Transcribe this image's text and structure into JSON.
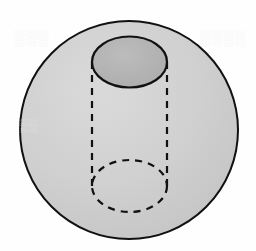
{
  "figure": {
    "title": "Sphere with inscribed cylinder",
    "background_color": "#fefefe",
    "canvas": {
      "width": 256,
      "height": 251
    }
  },
  "sphere": {
    "name": "sphere",
    "center_x": 129,
    "center_y": 130,
    "radius_x": 109,
    "radius_y": 109,
    "fill_color": "#cfcfcf",
    "stroke_color": "#111111",
    "stroke_width": 2.0
  },
  "cylinder": {
    "name": "cylinder",
    "axis_x": 129.5,
    "radius_x": 37.5,
    "top": {
      "label": "cylinder-top-ellipse",
      "center_y": 62,
      "radius_y": 25.5,
      "fill_color": "#b4b4b4",
      "stroke_color": "#111111",
      "stroke_width": 2.2,
      "stroke_style": "solid"
    },
    "bottom": {
      "label": "cylinder-bottom-ellipse",
      "center_y": 186,
      "radius_y": 26,
      "fill_color": "none",
      "stroke_color": "#111111",
      "stroke_width": 2.2,
      "stroke_style": "dashed",
      "dash_pattern": "7 6"
    },
    "left_side": {
      "label": "cylinder-left-side",
      "x": 92,
      "y_start": 62,
      "y_end": 186,
      "stroke_color": "#111111",
      "stroke_width": 2.2,
      "stroke_style": "dashed",
      "dash_pattern": "7 6"
    },
    "right_side": {
      "label": "cylinder-right-side",
      "x": 167,
      "y_start": 62,
      "y_end": 186,
      "stroke_color": "#111111",
      "stroke_width": 2.2,
      "stroke_style": "dashed",
      "dash_pattern": "7 6"
    }
  },
  "artifacts": {
    "note": "faint scanner bleed-through marks on the page background",
    "marks": [
      {
        "id": "ghost-left",
        "text": "░░░"
      },
      {
        "id": "ghost-right",
        "text": "░░░░"
      },
      {
        "id": "ghost-mid",
        "text": "░░"
      }
    ]
  }
}
